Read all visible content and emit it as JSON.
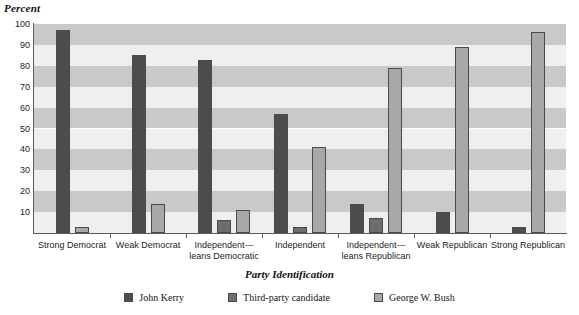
{
  "chart_data": {
    "type": "bar",
    "title": "",
    "ylabel": "Percent",
    "xlabel": "Party Identification",
    "ylim": [
      0,
      100
    ],
    "yticks": [
      10,
      20,
      30,
      40,
      50,
      60,
      70,
      80,
      90,
      100
    ],
    "grid": "horizontal alternating bands every 10 units",
    "legend_position": "bottom-center",
    "categories": [
      "Strong Democrat",
      "Weak Democrat",
      "Independent—\nleans Democratic",
      "Independent",
      "Independent—\nleans Republican",
      "Weak Republican",
      "Strong Republican"
    ],
    "series": [
      {
        "name": "John Kerry",
        "color": "#4d4d4d",
        "values": [
          97,
          85,
          83,
          57,
          14,
          10,
          3
        ]
      },
      {
        "name": "Third-party candidate",
        "color": "#6e6e6e",
        "values": [
          0,
          0,
          6,
          3,
          7,
          0,
          0
        ]
      },
      {
        "name": "George W. Bush",
        "color": "#a8a8a8",
        "values": [
          3,
          14,
          11,
          41,
          79,
          89,
          96
        ]
      }
    ]
  },
  "axis": {
    "y_title": "Percent",
    "x_title": "Party Identification",
    "tick_labels": [
      "100",
      "90",
      "80",
      "70",
      "60",
      "50",
      "40",
      "30",
      "20",
      "10"
    ]
  },
  "category_labels": [
    {
      "line1": "Strong Democrat",
      "line2": ""
    },
    {
      "line1": "Weak Democrat",
      "line2": ""
    },
    {
      "line1": "Independent—",
      "line2": "leans Democratic"
    },
    {
      "line1": "Independent",
      "line2": ""
    },
    {
      "line1": "Independent—",
      "line2": "leans Republican"
    },
    {
      "line1": "Weak Republican",
      "line2": ""
    },
    {
      "line1": "Strong Republican",
      "line2": ""
    }
  ],
  "legend": [
    {
      "label": "John Kerry",
      "swatch": "sw-kerry"
    },
    {
      "label": "Third-party candidate",
      "swatch": "sw-third"
    },
    {
      "label": "George W. Bush",
      "swatch": "sw-bush"
    }
  ]
}
